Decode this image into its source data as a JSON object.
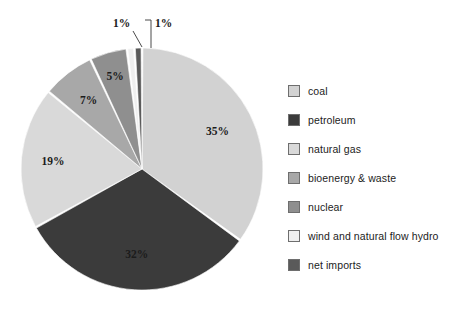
{
  "chart_data": {
    "type": "pie",
    "title": "",
    "subtitle": "",
    "xlabel": "",
    "ylabel": "",
    "legend_position": "right",
    "grid": false,
    "start_angle_deg": 0,
    "direction": "clockwise",
    "categories": [
      "coal",
      "petroleum",
      "natural gas",
      "bioenergy & waste",
      "nuclear",
      "wind and natural flow hydro",
      "net imports"
    ],
    "values": [
      35,
      32,
      19,
      7,
      5,
      1,
      1
    ],
    "value_unit": "%",
    "data_labels": [
      "35%",
      "32%",
      "19%",
      "7%",
      "5%",
      "1%",
      "1%"
    ],
    "colors": [
      "#d2d2d2",
      "#3b3b3b",
      "#d9d9d9",
      "#a8a8a8",
      "#8f8f8f",
      "#efefef",
      "#5a5a5a"
    ],
    "slices": [
      {
        "label": "coal",
        "value": 35,
        "data_label": "35%",
        "color": "#d2d2d2",
        "label_color": "#1c1c1c",
        "callout": false
      },
      {
        "label": "petroleum",
        "value": 32,
        "data_label": "32%",
        "color": "#3b3b3b",
        "label_color": "#f2f2f2",
        "callout": false
      },
      {
        "label": "natural gas",
        "value": 19,
        "data_label": "19%",
        "color": "#d9d9d9",
        "label_color": "#1c1c1c",
        "callout": false
      },
      {
        "label": "bioenergy & waste",
        "value": 7,
        "data_label": "7%",
        "color": "#a8a8a8",
        "label_color": "#1c1c1c",
        "callout": false
      },
      {
        "label": "nuclear",
        "value": 5,
        "data_label": "5%",
        "color": "#8f8f8f",
        "label_color": "#1c1c1c",
        "callout": false
      },
      {
        "label": "wind and natural flow hydro",
        "value": 1,
        "data_label": "1%",
        "color": "#efefef",
        "label_color": "#1c1c1c",
        "callout": true
      },
      {
        "label": "net imports",
        "value": 1,
        "data_label": "1%",
        "color": "#5a5a5a",
        "label_color": "#1c1c1c",
        "callout": true
      }
    ]
  },
  "labels": {
    "coal_pct": "35%",
    "petroleum_pct": "32%",
    "natural_gas_pct": "19%",
    "bioenergy_pct": "7%",
    "nuclear_pct": "5%",
    "wind_pct": "1%",
    "net_imports_pct": "1%"
  },
  "legend": {
    "items": [
      {
        "label": "coal",
        "color": "#d2d2d2"
      },
      {
        "label": "petroleum",
        "color": "#3b3b3b"
      },
      {
        "label": "natural gas",
        "color": "#d9d9d9"
      },
      {
        "label": "bioenergy & waste",
        "color": "#a8a8a8"
      },
      {
        "label": "nuclear",
        "color": "#8f8f8f"
      },
      {
        "label": "wind and natural flow hydro",
        "color": "#efefef"
      },
      {
        "label": "net imports",
        "color": "#5a5a5a"
      }
    ]
  }
}
